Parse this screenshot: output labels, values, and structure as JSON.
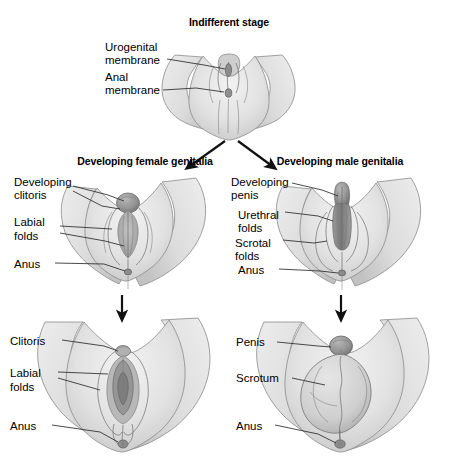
{
  "figure": {
    "title_indifferent": "Indifferent stage",
    "title_female": "Developing female genitalia",
    "title_male": "Developing male genitalia",
    "colors": {
      "ink": "#1a1a1a",
      "skin_light": "#e9e9e9",
      "skin_mid": "#d2d2d2",
      "skin_shadow": "#b4b4b4",
      "organ_dark": "#8e8e8e",
      "outline": "#8a8a8a",
      "leader": "#2a2a2a",
      "arrow": "#111111",
      "background": "#ffffff"
    },
    "panels": [
      {
        "id": "indifferent",
        "stage": "Indifferent stage",
        "row": "top",
        "column": "center",
        "labels": [
          {
            "id": "urogenital-membrane",
            "lines": [
              "Urogenital",
              "membrane"
            ]
          },
          {
            "id": "anal-membrane",
            "lines": [
              "Anal",
              "membrane"
            ]
          }
        ]
      },
      {
        "id": "developing-female",
        "stage": "Developing female genitalia",
        "row": "middle",
        "column": "left",
        "labels": [
          {
            "id": "developing-clitoris",
            "lines": [
              "Developing",
              "clitoris"
            ]
          },
          {
            "id": "labial-folds",
            "lines": [
              "Labial",
              "folds"
            ]
          },
          {
            "id": "anus",
            "lines": [
              "Anus"
            ]
          }
        ]
      },
      {
        "id": "developing-male",
        "stage": "Developing male genitalia",
        "row": "middle",
        "column": "right",
        "labels": [
          {
            "id": "developing-penis",
            "lines": [
              "Developing",
              "penis"
            ]
          },
          {
            "id": "urethral-folds",
            "lines": [
              "Urethral",
              "folds"
            ]
          },
          {
            "id": "scrotal-folds",
            "lines": [
              "Scrotal",
              "folds"
            ]
          },
          {
            "id": "anus",
            "lines": [
              "Anus"
            ]
          }
        ]
      },
      {
        "id": "mature-female",
        "stage": "Mature female genitalia",
        "row": "bottom",
        "column": "left",
        "labels": [
          {
            "id": "clitoris",
            "lines": [
              "Clitoris"
            ]
          },
          {
            "id": "labial-folds",
            "lines": [
              "Labial",
              "folds"
            ]
          },
          {
            "id": "anus",
            "lines": [
              "Anus"
            ]
          }
        ]
      },
      {
        "id": "mature-male",
        "stage": "Mature male genitalia",
        "row": "bottom",
        "column": "right",
        "labels": [
          {
            "id": "penis",
            "lines": [
              "Penis"
            ]
          },
          {
            "id": "scrotum",
            "lines": [
              "Scrotum"
            ]
          },
          {
            "id": "anus",
            "lines": [
              "Anus"
            ]
          }
        ]
      }
    ],
    "label_text": {
      "urogenital_1": "Urogenital",
      "urogenital_2": "membrane",
      "anal_1": "Anal",
      "anal_2": "membrane",
      "dev_clitoris_1": "Developing",
      "dev_clitoris_2": "clitoris",
      "labial_folds_mid_1": "Labial",
      "labial_folds_mid_2": "folds",
      "anus_female_mid": "Anus",
      "dev_penis_1": "Developing",
      "dev_penis_2": "penis",
      "urethral_folds_1": "Urethral",
      "urethral_folds_2": "folds",
      "scrotal_folds_1": "Scrotal",
      "scrotal_folds_2": "folds",
      "anus_male_mid": "Anus",
      "clitoris": "Clitoris",
      "labial_folds_bot_1": "Labial",
      "labial_folds_bot_2": "folds",
      "anus_female_bot": "Anus",
      "penis": "Penis",
      "scrotum": "Scrotum",
      "anus_male_bot": "Anus"
    },
    "arrows": [
      {
        "id": "branch-to-female",
        "from": [
          228,
          140
        ],
        "to": [
          188,
          168
        ],
        "direction": "down-left"
      },
      {
        "id": "branch-to-male",
        "from": [
          236,
          140
        ],
        "to": [
          272,
          168
        ],
        "direction": "down-right"
      },
      {
        "id": "female-progress",
        "from": [
          122,
          294
        ],
        "to": [
          122,
          320
        ],
        "direction": "down"
      },
      {
        "id": "male-progress",
        "from": [
          341,
          294
        ],
        "to": [
          341,
          320
        ],
        "direction": "down"
      }
    ]
  }
}
